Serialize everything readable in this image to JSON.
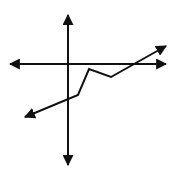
{
  "diagram": {
    "type": "coordinate-plane-piecewise-graph",
    "colors": {
      "background": "#ffffff",
      "stroke": "#111111",
      "arrow_fill": "#111111"
    },
    "axes": {
      "x_axis": {
        "y": 64,
        "x_start": 10,
        "x_end": 166,
        "arrows": [
          "left",
          "right"
        ]
      },
      "y_axis": {
        "x": 68,
        "y_start": 15,
        "y_end": 165,
        "arrows": [
          "up",
          "down"
        ]
      }
    },
    "graph": {
      "description": "piecewise linear function with arrows at both ends",
      "points": [
        [
          25,
          117
        ],
        [
          78,
          95
        ],
        [
          89,
          69
        ],
        [
          111,
          77
        ],
        [
          166,
          46
        ]
      ],
      "arrows": [
        "start",
        "end"
      ]
    }
  }
}
